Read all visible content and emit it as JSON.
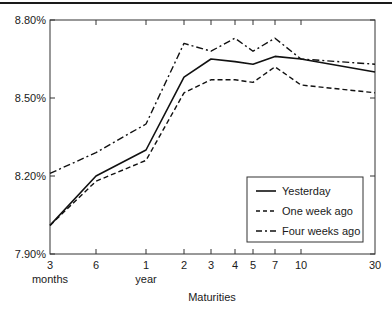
{
  "chart_data": {
    "type": "line",
    "title": "",
    "xlabel": "Maturities",
    "ylabel": "",
    "ylim": [
      7.9,
      8.8
    ],
    "grid": false,
    "legend_position": "lower right (inside plot)",
    "x": [
      "3 months",
      "6 months",
      "1 year",
      "2",
      "3",
      "4",
      "5",
      "7",
      "10",
      "30"
    ],
    "x_tick_labels": [
      {
        "top": "3",
        "bottom": "months"
      },
      {
        "top": "6",
        "bottom": ""
      },
      {
        "top": "1",
        "bottom": "year"
      },
      {
        "top": "2",
        "bottom": ""
      },
      {
        "top": "3",
        "bottom": ""
      },
      {
        "top": "4",
        "bottom": ""
      },
      {
        "top": "5",
        "bottom": ""
      },
      {
        "top": "7",
        "bottom": ""
      },
      {
        "top": "10",
        "bottom": ""
      },
      {
        "top": "30",
        "bottom": ""
      }
    ],
    "y_ticks": [
      "8.80%",
      "8.50%",
      "8.20%",
      "7.90%"
    ],
    "y_tick_values": [
      8.8,
      8.5,
      8.2,
      7.9
    ],
    "series": [
      {
        "name": "Yesterday",
        "style": "solid",
        "values": [
          8.01,
          8.2,
          8.3,
          8.58,
          8.65,
          8.64,
          8.63,
          8.66,
          8.65,
          8.6
        ]
      },
      {
        "name": "One week ago",
        "style": "dashed",
        "values": [
          8.01,
          8.18,
          8.26,
          8.52,
          8.57,
          8.57,
          8.56,
          8.62,
          8.55,
          8.52
        ]
      },
      {
        "name": "Four weeks ago",
        "style": "dash-dot",
        "values": [
          8.21,
          8.29,
          8.4,
          8.71,
          8.68,
          8.73,
          8.68,
          8.73,
          8.65,
          8.63
        ]
      }
    ]
  },
  "legend": {
    "items": [
      {
        "label": "Yesterday"
      },
      {
        "label": "One week ago"
      },
      {
        "label": "Four weeks ago"
      }
    ]
  },
  "axis": {
    "x_title": "Maturities"
  }
}
